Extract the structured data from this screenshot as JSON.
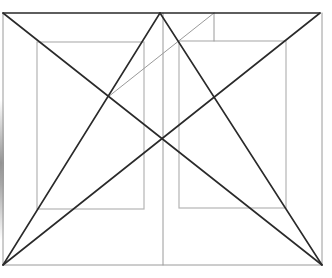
{
  "diagram": {
    "title": "",
    "colors": {
      "background": "#ffffff",
      "heavy_line": "#2a2a2a",
      "light_line": "#b4b4b4",
      "frame_line": "#9a9a9a"
    },
    "frame": {
      "x1": 3,
      "y1": 13,
      "x2": 322,
      "y2": 265
    },
    "heavy_lines": [
      {
        "id": "top-edge",
        "x1": 3,
        "y1": 13,
        "x2": 320,
        "y2": 13
      },
      {
        "id": "diag-topleft-to-bottomright",
        "x1": 3,
        "y1": 13,
        "x2": 322,
        "y2": 265
      },
      {
        "id": "diag-bottomleft-to-topright",
        "x1": 3,
        "y1": 265,
        "x2": 320,
        "y2": 13
      },
      {
        "id": "bottomleft-to-apex",
        "x1": 3,
        "y1": 265,
        "x2": 160,
        "y2": 13
      },
      {
        "id": "bottomright-to-apex",
        "x1": 322,
        "y1": 265,
        "x2": 160,
        "y2": 13
      }
    ],
    "light_lines": [
      {
        "id": "left-edge",
        "x1": 3,
        "y1": 13,
        "x2": 3,
        "y2": 265
      },
      {
        "id": "right-edge",
        "x1": 322,
        "y1": 13,
        "x2": 322,
        "y2": 265
      },
      {
        "id": "bottom-edge",
        "x1": 3,
        "y1": 265,
        "x2": 322,
        "y2": 265
      },
      {
        "id": "center-vertical",
        "x1": 163,
        "y1": 13,
        "x2": 163,
        "y2": 265
      },
      {
        "id": "upper-vertical",
        "x1": 214,
        "y1": 13,
        "x2": 214,
        "y2": 41
      },
      {
        "id": "light-diagonal",
        "x1": 214,
        "y1": 13,
        "x2": 108,
        "y2": 97
      }
    ],
    "rectangles": [
      {
        "id": "left-inner-rect",
        "x": 37,
        "y": 42,
        "width": 107,
        "height": 167
      },
      {
        "id": "right-inner-rect",
        "x": 179,
        "y": 41,
        "width": 107,
        "height": 167
      }
    ],
    "apex": {
      "x": 160,
      "y": 13
    }
  }
}
